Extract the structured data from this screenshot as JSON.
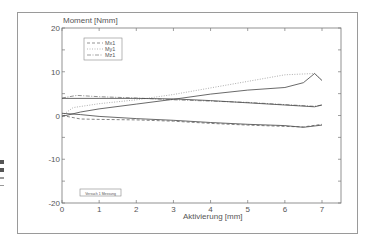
{
  "chart_data": {
    "type": "line",
    "title": "",
    "ylabel": "Moment [Nmm]",
    "xlabel": "Aktivierung [mm]",
    "xlim": [
      0,
      7.5
    ],
    "ylim": [
      -20,
      20
    ],
    "x_ticks": [
      "0",
      "1",
      "2",
      "3",
      "4",
      "5",
      "6",
      "7"
    ],
    "y_ticks": [
      "20",
      "10",
      "0",
      "-10",
      "-20"
    ],
    "grid": false,
    "legend": {
      "position": "upper-left",
      "entries": [
        "Mx1",
        "My1",
        "Mz1"
      ]
    },
    "annotation": "Versuch 1 Messung",
    "series": [
      {
        "name": "Mx1",
        "style": "dashed",
        "x": [
          0,
          0.5,
          1,
          2,
          3,
          4,
          5,
          6,
          6.5,
          7
        ],
        "y": [
          0,
          -0.8,
          -0.9,
          -1.0,
          -1.3,
          -1.8,
          -2.2,
          -2.5,
          -2.6,
          -2.0
        ]
      },
      {
        "name": "My1",
        "style": "dotted",
        "x": [
          0,
          0.3,
          1,
          2,
          3,
          4,
          5,
          6,
          6.8,
          7
        ],
        "y": [
          0,
          1.8,
          2.7,
          3.6,
          4.8,
          6.3,
          7.8,
          9.3,
          9.6,
          8.0
        ]
      },
      {
        "name": "Mz1",
        "style": "dashdot",
        "x": [
          0,
          0.4,
          1,
          2,
          3,
          4,
          5,
          6,
          6.8,
          7
        ],
        "y": [
          4.0,
          4.6,
          4.3,
          4.0,
          3.6,
          3.3,
          3.0,
          2.5,
          2.1,
          2.4
        ]
      },
      {
        "name": "Mx1 (solid)",
        "style": "solid",
        "x": [
          0,
          0.5,
          1,
          2,
          3,
          4,
          5,
          6,
          6.5,
          7
        ],
        "y": [
          0.5,
          0.2,
          -0.2,
          -0.7,
          -1.1,
          -1.6,
          -2.0,
          -2.3,
          -2.7,
          -2.2
        ]
      },
      {
        "name": "My1 (solid)",
        "style": "solid",
        "x": [
          0,
          0.5,
          1,
          2,
          3,
          4,
          5,
          6,
          6.5,
          6.8,
          7
        ],
        "y": [
          -0.2,
          0.8,
          1.5,
          2.6,
          3.7,
          4.9,
          5.8,
          6.4,
          7.5,
          9.6,
          8.0
        ]
      },
      {
        "name": "Mz1 (solid)",
        "style": "solid",
        "x": [
          0,
          1,
          2,
          3,
          4,
          5,
          6,
          6.8,
          7
        ],
        "y": [
          3.9,
          3.9,
          3.9,
          3.8,
          3.4,
          2.9,
          2.4,
          2.0,
          2.4
        ]
      }
    ]
  }
}
